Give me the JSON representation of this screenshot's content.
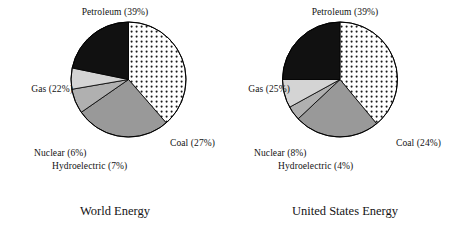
{
  "figure": {
    "background": "#ffffff",
    "outline_color": "#000000"
  },
  "charts": [
    {
      "id": "world-energy",
      "title": "World Energy",
      "labels": {
        "petroleum": "Petroleum (39%)",
        "gas": "Gas (22%)",
        "coal": "Coal (27%)",
        "nuclear": "Nuclear (6%)",
        "hydroelectric": "Hydroelectric (7%)"
      }
    },
    {
      "id": "united-states-energy",
      "title": "United States Energy",
      "labels": {
        "petroleum": "Petroleum (39%)",
        "gas": "Gas (25%)",
        "coal": "Coal (24%)",
        "nuclear": "Nuclear (8%)",
        "hydroelectric": "Hydroelectric (4%)"
      }
    }
  ],
  "chart_data": [
    {
      "type": "pie",
      "title": "World Energy",
      "categories": [
        "Petroleum",
        "Coal",
        "Hydroelectric",
        "Nuclear",
        "Gas"
      ],
      "values": [
        39,
        27,
        7,
        6,
        22
      ],
      "unit": "%",
      "start_angle_deg": 0,
      "direction": "clockwise",
      "colors": [
        "#ffffff",
        "#999999",
        "#b0b0b0",
        "#d4d4d4",
        "#111111"
      ],
      "fills": [
        "dotted",
        "solid-gray",
        "solid-light-gray",
        "solid-lighter-gray",
        "solid-black"
      ],
      "data_labels": [
        "Petroleum (39%)",
        "Coal (27%)",
        "Hydroelectric (7%)",
        "Nuclear (6%)",
        "Gas (22%)"
      ],
      "legend": "none",
      "grid": false
    },
    {
      "type": "pie",
      "title": "United States Energy",
      "categories": [
        "Petroleum",
        "Coal",
        "Hydroelectric",
        "Nuclear",
        "Gas"
      ],
      "values": [
        39,
        24,
        4,
        8,
        25
      ],
      "unit": "%",
      "start_angle_deg": 0,
      "direction": "clockwise",
      "colors": [
        "#ffffff",
        "#999999",
        "#b0b0b0",
        "#d4d4d4",
        "#111111"
      ],
      "fills": [
        "dotted",
        "solid-gray",
        "solid-light-gray",
        "solid-lighter-gray",
        "solid-black"
      ],
      "data_labels": [
        "Petroleum (39%)",
        "Coal (24%)",
        "Hydroelectric (4%)",
        "Nuclear (8%)",
        "Gas (25%)"
      ],
      "legend": "none",
      "grid": false
    }
  ]
}
